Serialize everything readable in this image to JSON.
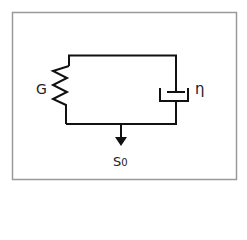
{
  "diagram": {
    "type": "Kelvin-Voigt viscoelastic model",
    "frame_color": "#9a9a9a",
    "line_color": "#111111",
    "elements": {
      "spring": {
        "label": "G"
      },
      "dashpot": {
        "label": "η"
      },
      "load": {
        "label_main": "S",
        "label_sub": "0"
      }
    }
  }
}
